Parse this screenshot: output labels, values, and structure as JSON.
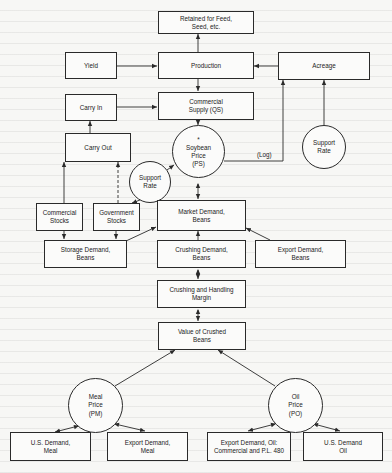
{
  "diagram": {
    "nodes": {
      "retained": {
        "label": "Retained for Feed,\nSeed, etc."
      },
      "yield": {
        "label": "Yield"
      },
      "production": {
        "label": "Production"
      },
      "acreage": {
        "label": "Acreage"
      },
      "carry_in": {
        "label": "Carry In"
      },
      "commercial_supply": {
        "label": "Commercial\nSupply (QS)"
      },
      "support_rate_acreage": {
        "label": "Support\nRate"
      },
      "carry_out": {
        "label": "Carry Out"
      },
      "soybean_price": {
        "label": "*\nSoybean\nPrice\n(PS)"
      },
      "support_rate_stocks": {
        "label": "Support\nRate"
      },
      "commercial_stocks": {
        "label": "Commercial\nStocks"
      },
      "government_stocks": {
        "label": "Government\nStocks"
      },
      "market_demand": {
        "label": "Market Demand,\nBeans"
      },
      "storage_demand": {
        "label": "Storage Demand,\nBeans"
      },
      "crushing_demand": {
        "label": "Crushing Demand,\nBeans"
      },
      "export_demand_beans": {
        "label": "Export Demand,\nBeans"
      },
      "crushing_margin": {
        "label": "Crushing and Handling\nMargin"
      },
      "value_crushed": {
        "label": "Value of Crushed\nBeans"
      },
      "meal_price": {
        "label": "Meal\nPrice\n(PM)"
      },
      "oil_price": {
        "label": "Oil\nPrice\n(PO)"
      },
      "us_demand_meal": {
        "label": "U.S. Demand,\nMeal"
      },
      "export_demand_meal": {
        "label": "Export Demand,\nMeal"
      },
      "export_demand_oil": {
        "label": "Export Demand, Oil:\nCommercial and P.L. 480"
      },
      "us_demand_oil": {
        "label": "U.S. Demand\nOil"
      }
    },
    "edge_labels": {
      "lag": "(Log)"
    },
    "colors": {
      "line": "#2a2a2a",
      "background": "#f7f7f5"
    }
  }
}
